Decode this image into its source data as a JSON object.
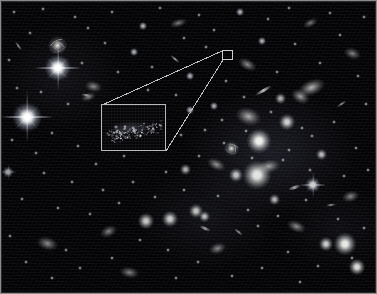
{
  "figure": {
    "type": "astronomical-deep-field",
    "width": 377,
    "height": 294,
    "background_color": "#030305",
    "frame_color": "#8a8a8a",
    "annotation_color": "#bfbfbf"
  },
  "callout": {
    "name": "magnification-callout",
    "source_box": {
      "label": "source-region-marker",
      "x": 222,
      "y": 50,
      "width": 11,
      "height": 10,
      "stroke": "#cfcfcf"
    },
    "inset_box": {
      "label": "magnified-inset",
      "x": 101,
      "y": 104,
      "width": 65,
      "height": 47,
      "stroke": "#b9b9b9",
      "content": "faint diffuse clump of unresolved point sources"
    },
    "leader_lines": [
      {
        "from_x": 222,
        "from_y": 51,
        "to_x": 102,
        "to_y": 105
      },
      {
        "from_x": 223,
        "from_y": 60,
        "to_x": 166,
        "to_y": 151
      }
    ]
  },
  "chart_data": {
    "type": "scatter",
    "xlabel": "",
    "ylabel": "",
    "xlim": [
      0,
      377
    ],
    "ylim": [
      0,
      294
    ],
    "grid": false,
    "legend": "none",
    "annotations": [
      "magnified inset box at (101,104) size 65x47",
      "source marker box at (222,50) size 11x10",
      "two leader lines connecting source marker to inset corners"
    ],
    "series": [
      {
        "name": "bright-diffraction-stars",
        "marker": "star-with-spikes",
        "points": [
          {
            "x": 58,
            "y": 68,
            "size": 12,
            "spike": 46,
            "brightness": 1.0
          },
          {
            "x": 27,
            "y": 117,
            "size": 13,
            "spike": 52,
            "brightness": 1.0
          },
          {
            "x": 313,
            "y": 185,
            "size": 7,
            "spike": 26,
            "brightness": 0.8
          },
          {
            "x": 8,
            "y": 172,
            "size": 5,
            "spike": 15,
            "brightness": 0.62
          }
        ]
      },
      {
        "name": "spiral-galaxies",
        "marker": "spiral",
        "points": [
          {
            "x": 57,
            "y": 45,
            "size": 19,
            "rot": -28,
            "brightness": 0.92
          },
          {
            "x": 231,
            "y": 148,
            "size": 15,
            "rot": 22,
            "brightness": 0.88
          }
        ]
      },
      {
        "name": "bright-core-galaxies",
        "marker": "core",
        "points": [
          {
            "x": 259,
            "y": 141,
            "size": 11,
            "brightness": 0.95
          },
          {
            "x": 257,
            "y": 175,
            "size": 13,
            "brightness": 0.9
          },
          {
            "x": 345,
            "y": 244,
            "size": 10,
            "brightness": 0.92
          },
          {
            "x": 357,
            "y": 267,
            "size": 7,
            "brightness": 0.86
          },
          {
            "x": 326,
            "y": 244,
            "size": 6,
            "brightness": 0.78
          },
          {
            "x": 287,
            "y": 122,
            "size": 7,
            "brightness": 0.8
          },
          {
            "x": 236,
            "y": 175,
            "size": 6,
            "brightness": 0.74
          },
          {
            "x": 170,
            "y": 219,
            "size": 7,
            "brightness": 0.78
          },
          {
            "x": 196,
            "y": 211,
            "size": 6,
            "brightness": 0.74
          },
          {
            "x": 146,
            "y": 221,
            "size": 7,
            "brightness": 0.76
          },
          {
            "x": 204,
            "y": 216,
            "size": 5,
            "brightness": 0.7
          },
          {
            "x": 274,
            "y": 199,
            "size": 5,
            "brightness": 0.68
          },
          {
            "x": 321,
            "y": 154,
            "size": 5,
            "brightness": 0.7
          },
          {
            "x": 185,
            "y": 169,
            "size": 5,
            "brightness": 0.66
          },
          {
            "x": 280,
            "y": 98,
            "size": 5,
            "brightness": 0.66
          }
        ]
      },
      {
        "name": "elliptical-fuzzy-galaxies",
        "marker": "fuzz",
        "points": [
          {
            "x": 249,
            "y": 116,
            "w": 12,
            "h": 8,
            "rot": 18,
            "brightness": 0.72
          },
          {
            "x": 312,
            "y": 87,
            "w": 13,
            "h": 7,
            "rot": -22,
            "brightness": 0.76
          },
          {
            "x": 300,
            "y": 96,
            "w": 9,
            "h": 6,
            "rot": 30,
            "brightness": 0.66
          },
          {
            "x": 269,
            "y": 166,
            "w": 11,
            "h": 6,
            "rot": -12,
            "brightness": 0.66
          },
          {
            "x": 216,
            "y": 164,
            "w": 9,
            "h": 5,
            "rot": 26,
            "brightness": 0.6
          },
          {
            "x": 93,
            "y": 86,
            "w": 8,
            "h": 5,
            "rot": 12,
            "brightness": 0.56
          },
          {
            "x": 88,
            "y": 97,
            "w": 7,
            "h": 4,
            "rot": -20,
            "brightness": 0.52
          },
          {
            "x": 47,
            "y": 243,
            "w": 10,
            "h": 6,
            "rot": 16,
            "brightness": 0.58
          },
          {
            "x": 108,
            "y": 231,
            "w": 8,
            "h": 5,
            "rot": -24,
            "brightness": 0.54
          },
          {
            "x": 129,
            "y": 272,
            "w": 9,
            "h": 5,
            "rot": 10,
            "brightness": 0.54
          },
          {
            "x": 217,
            "y": 248,
            "w": 8,
            "h": 5,
            "rot": -18,
            "brightness": 0.56
          },
          {
            "x": 296,
            "y": 226,
            "w": 9,
            "h": 5,
            "rot": 22,
            "brightness": 0.58
          },
          {
            "x": 350,
            "y": 196,
            "w": 8,
            "h": 5,
            "rot": -14,
            "brightness": 0.56
          },
          {
            "x": 247,
            "y": 64,
            "w": 9,
            "h": 5,
            "rot": 28,
            "brightness": 0.58
          },
          {
            "x": 178,
            "y": 23,
            "w": 8,
            "h": 4,
            "rot": -16,
            "brightness": 0.52
          },
          {
            "x": 352,
            "y": 53,
            "w": 8,
            "h": 5,
            "rot": 20,
            "brightness": 0.54
          },
          {
            "x": 310,
            "y": 23,
            "w": 7,
            "h": 4,
            "rot": -26,
            "brightness": 0.5
          }
        ]
      },
      {
        "name": "edge-on-streak-galaxies",
        "marker": "streak",
        "points": [
          {
            "x": 263,
            "y": 90,
            "len": 19,
            "thick": 3,
            "rot": -30,
            "brightness": 0.74
          },
          {
            "x": 175,
            "y": 59,
            "len": 12,
            "thick": 2,
            "rot": 42,
            "brightness": 0.6
          },
          {
            "x": 18,
            "y": 46,
            "len": 11,
            "thick": 2,
            "rot": 55,
            "brightness": 0.54
          },
          {
            "x": 294,
            "y": 187,
            "len": 13,
            "thick": 3,
            "rot": -18,
            "brightness": 0.62
          },
          {
            "x": 205,
            "y": 228,
            "len": 12,
            "thick": 3,
            "rot": 24,
            "brightness": 0.6
          },
          {
            "x": 341,
            "y": 104,
            "len": 11,
            "thick": 2,
            "rot": -34,
            "brightness": 0.56
          },
          {
            "x": 86,
            "y": 95,
            "len": 10,
            "thick": 2,
            "rot": 8,
            "brightness": 0.52
          },
          {
            "x": 238,
            "y": 232,
            "len": 11,
            "thick": 2,
            "rot": 40,
            "brightness": 0.54
          },
          {
            "x": 331,
            "y": 205,
            "len": 10,
            "thick": 2,
            "rot": -8,
            "brightness": 0.52
          }
        ]
      },
      {
        "name": "faint-point-sources",
        "marker": "point",
        "points": [
          {
            "x": 14,
            "y": 12,
            "s": 2
          },
          {
            "x": 43,
            "y": 9,
            "s": 2
          },
          {
            "x": 75,
            "y": 17,
            "s": 2
          },
          {
            "x": 112,
            "y": 12,
            "s": 2
          },
          {
            "x": 143,
            "y": 26,
            "s": 3
          },
          {
            "x": 160,
            "y": 8,
            "s": 2
          },
          {
            "x": 199,
            "y": 15,
            "s": 2
          },
          {
            "x": 214,
            "y": 30,
            "s": 2
          },
          {
            "x": 240,
            "y": 12,
            "s": 3
          },
          {
            "x": 268,
            "y": 19,
            "s": 2
          },
          {
            "x": 289,
            "y": 8,
            "s": 2
          },
          {
            "x": 330,
            "y": 13,
            "s": 2
          },
          {
            "x": 364,
            "y": 17,
            "s": 2
          },
          {
            "x": 340,
            "y": 35,
            "s": 2
          },
          {
            "x": 295,
            "y": 44,
            "s": 2
          },
          {
            "x": 262,
            "y": 41,
            "s": 3
          },
          {
            "x": 206,
            "y": 47,
            "s": 2
          },
          {
            "x": 184,
            "y": 38,
            "s": 2
          },
          {
            "x": 134,
            "y": 52,
            "s": 3
          },
          {
            "x": 105,
            "y": 43,
            "s": 2
          },
          {
            "x": 88,
            "y": 28,
            "s": 2
          },
          {
            "x": 30,
            "y": 33,
            "s": 2
          },
          {
            "x": 9,
            "y": 60,
            "s": 2
          },
          {
            "x": 82,
            "y": 63,
            "s": 2
          },
          {
            "x": 118,
            "y": 72,
            "s": 2
          },
          {
            "x": 152,
            "y": 67,
            "s": 2
          },
          {
            "x": 190,
            "y": 76,
            "s": 3
          },
          {
            "x": 226,
            "y": 81,
            "s": 2
          },
          {
            "x": 244,
            "y": 97,
            "s": 2
          },
          {
            "x": 277,
            "y": 72,
            "s": 2
          },
          {
            "x": 320,
            "y": 63,
            "s": 2
          },
          {
            "x": 358,
            "y": 76,
            "s": 2
          },
          {
            "x": 366,
            "y": 104,
            "s": 2
          },
          {
            "x": 334,
            "y": 122,
            "s": 2
          },
          {
            "x": 302,
            "y": 128,
            "s": 2
          },
          {
            "x": 271,
            "y": 112,
            "s": 2
          },
          {
            "x": 214,
            "y": 106,
            "s": 3
          },
          {
            "x": 190,
            "y": 110,
            "s": 3
          },
          {
            "x": 176,
            "y": 95,
            "s": 2
          },
          {
            "x": 148,
            "y": 90,
            "s": 2
          },
          {
            "x": 68,
            "y": 104,
            "s": 2
          },
          {
            "x": 41,
            "y": 92,
            "s": 2
          },
          {
            "x": 17,
            "y": 88,
            "s": 2
          },
          {
            "x": 12,
            "y": 140,
            "s": 2
          },
          {
            "x": 52,
            "y": 133,
            "s": 2
          },
          {
            "x": 78,
            "y": 146,
            "s": 2
          },
          {
            "x": 96,
            "y": 164,
            "s": 2
          },
          {
            "x": 124,
            "y": 156,
            "s": 2
          },
          {
            "x": 152,
            "y": 145,
            "s": 2
          },
          {
            "x": 181,
            "y": 135,
            "s": 2
          },
          {
            "x": 205,
            "y": 130,
            "s": 2
          },
          {
            "x": 246,
            "y": 131,
            "s": 2
          },
          {
            "x": 289,
            "y": 150,
            "s": 2
          },
          {
            "x": 312,
            "y": 136,
            "s": 2
          },
          {
            "x": 356,
            "y": 148,
            "s": 2
          },
          {
            "x": 368,
            "y": 170,
            "s": 2
          },
          {
            "x": 344,
            "y": 176,
            "s": 2
          },
          {
            "x": 310,
            "y": 170,
            "s": 2
          },
          {
            "x": 283,
            "y": 160,
            "s": 2
          },
          {
            "x": 252,
            "y": 158,
            "s": 2
          },
          {
            "x": 224,
            "y": 143,
            "s": 2
          },
          {
            "x": 199,
            "y": 156,
            "s": 2
          },
          {
            "x": 166,
            "y": 172,
            "s": 2
          },
          {
            "x": 133,
            "y": 182,
            "s": 2
          },
          {
            "x": 103,
            "y": 190,
            "s": 2
          },
          {
            "x": 72,
            "y": 182,
            "s": 2
          },
          {
            "x": 44,
            "y": 173,
            "s": 2
          },
          {
            "x": 22,
            "y": 199,
            "s": 2
          },
          {
            "x": 58,
            "y": 208,
            "s": 2
          },
          {
            "x": 90,
            "y": 214,
            "s": 2
          },
          {
            "x": 119,
            "y": 203,
            "s": 2
          },
          {
            "x": 155,
            "y": 197,
            "s": 2
          },
          {
            "x": 184,
            "y": 190,
            "s": 2
          },
          {
            "x": 218,
            "y": 196,
            "s": 2
          },
          {
            "x": 248,
            "y": 210,
            "s": 2
          },
          {
            "x": 278,
            "y": 216,
            "s": 2
          },
          {
            "x": 306,
            "y": 200,
            "s": 2
          },
          {
            "x": 338,
            "y": 219,
            "s": 2
          },
          {
            "x": 364,
            "y": 228,
            "s": 2
          },
          {
            "x": 352,
            "y": 258,
            "s": 2
          },
          {
            "x": 318,
            "y": 266,
            "s": 2
          },
          {
            "x": 288,
            "y": 252,
            "s": 2
          },
          {
            "x": 262,
            "y": 268,
            "s": 2
          },
          {
            "x": 232,
            "y": 276,
            "s": 2
          },
          {
            "x": 198,
            "y": 262,
            "s": 2
          },
          {
            "x": 168,
            "y": 250,
            "s": 2
          },
          {
            "x": 140,
            "y": 240,
            "s": 2
          },
          {
            "x": 112,
            "y": 258,
            "s": 2
          },
          {
            "x": 80,
            "y": 268,
            "s": 2
          },
          {
            "x": 52,
            "y": 278,
            "s": 2
          },
          {
            "x": 26,
            "y": 262,
            "s": 2
          },
          {
            "x": 10,
            "y": 236,
            "s": 2
          },
          {
            "x": 66,
            "y": 250,
            "s": 2
          },
          {
            "x": 222,
            "y": 120,
            "s": 2
          },
          {
            "x": 258,
            "y": 226,
            "s": 2
          },
          {
            "x": 176,
            "y": 278,
            "s": 2
          },
          {
            "x": 300,
            "y": 282,
            "s": 2
          },
          {
            "x": 36,
            "y": 153,
            "s": 2
          }
        ]
      }
    ]
  }
}
